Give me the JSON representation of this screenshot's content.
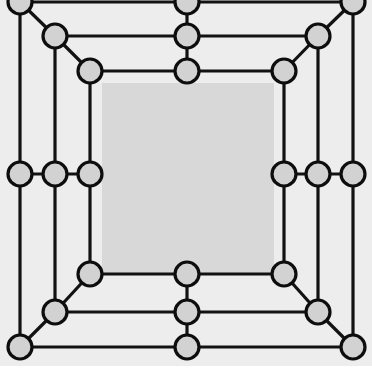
{
  "figure": {
    "type": "node-link-diagram",
    "width": 372,
    "height": 382,
    "node_count": 24,
    "ring_count": 3
  },
  "style": {
    "page_background": "#ffffff",
    "outer_background": "#ededed",
    "inner_panel_fill": "#d8d8d8",
    "node_fill": "#d2d2d2",
    "node_stroke": "#0d0d0d",
    "edge_stroke": "#121212",
    "edge_width": 3.2,
    "node_radius": 12,
    "node_stroke_width": 3.2
  },
  "geometry": {
    "center": {
      "x": 186,
      "y": 174.5
    },
    "rings": [
      {
        "name": "outer",
        "half_extent_x": 166,
        "half_extent_y": 172.5
      },
      {
        "name": "middle",
        "half_extent_x": 131,
        "half_extent_y": 138.5
      },
      {
        "name": "inner",
        "half_extent_x": 96,
        "half_extent_y": 102.5
      }
    ],
    "inner_panel": {
      "x": 102,
      "y": 83,
      "width": 172,
      "height": 190
    },
    "outer_panel": {
      "x": 0,
      "y": 0,
      "width": 372,
      "height": 366
    }
  },
  "nodes": [
    {
      "id": "o-tl",
      "ring": "outer",
      "role": "corner",
      "x": 20,
      "y": 2
    },
    {
      "id": "o-tm",
      "ring": "outer",
      "role": "midpoint",
      "x": 187,
      "y": 2
    },
    {
      "id": "o-tr",
      "ring": "outer",
      "role": "corner",
      "x": 353,
      "y": 2
    },
    {
      "id": "o-lm",
      "ring": "outer",
      "role": "midpoint",
      "x": 20,
      "y": 174
    },
    {
      "id": "o-rm",
      "ring": "outer",
      "role": "midpoint",
      "x": 353,
      "y": 174
    },
    {
      "id": "o-bl",
      "ring": "outer",
      "role": "corner",
      "x": 20,
      "y": 347
    },
    {
      "id": "o-bm",
      "ring": "outer",
      "role": "midpoint",
      "x": 187,
      "y": 347
    },
    {
      "id": "o-br",
      "ring": "outer",
      "role": "corner",
      "x": 353,
      "y": 347
    },
    {
      "id": "m-tl",
      "ring": "middle",
      "role": "corner",
      "x": 55,
      "y": 36
    },
    {
      "id": "m-tm",
      "ring": "middle",
      "role": "midpoint",
      "x": 187,
      "y": 36
    },
    {
      "id": "m-tr",
      "ring": "middle",
      "role": "corner",
      "x": 318,
      "y": 36
    },
    {
      "id": "m-lm",
      "ring": "middle",
      "role": "midpoint",
      "x": 55,
      "y": 174
    },
    {
      "id": "m-rm",
      "ring": "middle",
      "role": "midpoint",
      "x": 318,
      "y": 174
    },
    {
      "id": "m-bl",
      "ring": "middle",
      "role": "corner",
      "x": 55,
      "y": 312
    },
    {
      "id": "m-bm",
      "ring": "middle",
      "role": "midpoint",
      "x": 187,
      "y": 312
    },
    {
      "id": "m-br",
      "ring": "middle",
      "role": "corner",
      "x": 318,
      "y": 312
    },
    {
      "id": "i-tl",
      "ring": "inner",
      "role": "corner",
      "x": 90,
      "y": 71
    },
    {
      "id": "i-tm",
      "ring": "inner",
      "role": "midpoint",
      "x": 187,
      "y": 71
    },
    {
      "id": "i-tr",
      "ring": "inner",
      "role": "corner",
      "x": 284,
      "y": 71
    },
    {
      "id": "i-lm",
      "ring": "inner",
      "role": "midpoint",
      "x": 90,
      "y": 174
    },
    {
      "id": "i-rm",
      "ring": "inner",
      "role": "midpoint",
      "x": 284,
      "y": 174
    },
    {
      "id": "i-bl",
      "ring": "inner",
      "role": "corner",
      "x": 90,
      "y": 274
    },
    {
      "id": "i-bm",
      "ring": "inner",
      "role": "midpoint",
      "x": 187,
      "y": 274
    },
    {
      "id": "i-br",
      "ring": "inner",
      "role": "corner",
      "x": 284,
      "y": 274
    }
  ],
  "edges": [
    [
      "o-tl",
      "o-tm"
    ],
    [
      "o-tm",
      "o-tr"
    ],
    [
      "o-tl",
      "o-lm"
    ],
    [
      "o-lm",
      "o-bl"
    ],
    [
      "o-tr",
      "o-rm"
    ],
    [
      "o-rm",
      "o-br"
    ],
    [
      "o-bl",
      "o-bm"
    ],
    [
      "o-bm",
      "o-br"
    ],
    [
      "m-tl",
      "m-tm"
    ],
    [
      "m-tm",
      "m-tr"
    ],
    [
      "m-tl",
      "m-lm"
    ],
    [
      "m-lm",
      "m-bl"
    ],
    [
      "m-tr",
      "m-rm"
    ],
    [
      "m-rm",
      "m-br"
    ],
    [
      "m-bl",
      "m-bm"
    ],
    [
      "m-bm",
      "m-br"
    ],
    [
      "i-tl",
      "i-tm"
    ],
    [
      "i-tm",
      "i-tr"
    ],
    [
      "i-tl",
      "i-lm"
    ],
    [
      "i-lm",
      "i-bl"
    ],
    [
      "i-tr",
      "i-rm"
    ],
    [
      "i-rm",
      "i-br"
    ],
    [
      "i-bl",
      "i-bm"
    ],
    [
      "i-bm",
      "i-br"
    ],
    [
      "o-tl",
      "m-tl"
    ],
    [
      "m-tl",
      "i-tl"
    ],
    [
      "o-tr",
      "m-tr"
    ],
    [
      "m-tr",
      "i-tr"
    ],
    [
      "o-bl",
      "m-bl"
    ],
    [
      "m-bl",
      "i-bl"
    ],
    [
      "o-br",
      "m-br"
    ],
    [
      "m-br",
      "i-br"
    ],
    [
      "o-tm",
      "m-tm"
    ],
    [
      "m-tm",
      "i-tm"
    ],
    [
      "o-bm",
      "m-bm"
    ],
    [
      "m-bm",
      "i-bm"
    ],
    [
      "o-lm",
      "m-lm"
    ],
    [
      "m-lm",
      "i-lm"
    ],
    [
      "o-rm",
      "m-rm"
    ],
    [
      "m-rm",
      "i-rm"
    ]
  ]
}
